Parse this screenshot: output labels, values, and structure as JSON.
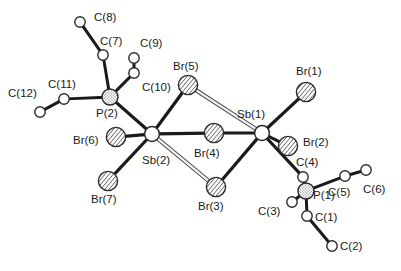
{
  "figure": {
    "kind": "crystal-structure-ortep-diagram",
    "title": "",
    "caption": "",
    "background_color": "#ffffff",
    "label_color": "#1a1a1a",
    "bond_color": "#1a1a1a",
    "hollow_bond_fill": "#f2f2f2",
    "hollow_bond_stroke": "#4d4d4d"
  },
  "styles": {
    "carbon": {
      "name": "carbon-open-circle",
      "fill": "#ffffff",
      "stroke": "#2b2b2b",
      "stroke_width": 1.4,
      "radius": 5.2
    },
    "phosphorus": {
      "name": "phosphorus-stippled-circle",
      "fill": "#e8e8e8",
      "stroke": "#2b2b2b",
      "stroke_width": 1.4,
      "radius": 8.0,
      "pattern": "stipple"
    },
    "bromine": {
      "name": "bromine-hatched-circle",
      "fill": "#d9d9d9",
      "stroke": "#2b2b2b",
      "stroke_width": 1.4,
      "radius": 9.6,
      "pattern": "diagonal-hatch"
    },
    "antimony": {
      "name": "antimony-open-circle",
      "fill": "#ffffff",
      "stroke": "#2b2b2b",
      "stroke_width": 1.5,
      "radius": 7.4
    }
  },
  "atoms": [
    {
      "id": "C8",
      "label": "C(8)",
      "element": "C",
      "style": "carbon",
      "x": 80,
      "y": 22,
      "label_x": 94,
      "label_y": 18,
      "anchor": "start"
    },
    {
      "id": "C7",
      "label": "C(7)",
      "element": "C",
      "style": "carbon",
      "x": 103,
      "y": 55,
      "label_x": 100,
      "label_y": 42,
      "anchor": "start"
    },
    {
      "id": "C9",
      "label": "C(9)",
      "element": "C",
      "style": "carbon",
      "x": 134,
      "y": 58,
      "label_x": 140,
      "label_y": 44,
      "anchor": "start"
    },
    {
      "id": "C10",
      "label": "C(10)",
      "element": "C",
      "style": "carbon",
      "x": 134,
      "y": 73,
      "label_x": 142,
      "label_y": 88,
      "anchor": "start"
    },
    {
      "id": "C11",
      "label": "C(11)",
      "element": "C",
      "style": "carbon",
      "x": 64,
      "y": 99,
      "label_x": 48,
      "label_y": 85,
      "anchor": "start"
    },
    {
      "id": "C12",
      "label": "C(12)",
      "element": "C",
      "style": "carbon",
      "x": 40,
      "y": 112,
      "label_x": 8,
      "label_y": 94,
      "anchor": "start"
    },
    {
      "id": "P2",
      "label": "P(2)",
      "element": "P",
      "style": "phosphorus",
      "x": 110,
      "y": 97,
      "label_x": 96,
      "label_y": 114,
      "anchor": "start"
    },
    {
      "id": "Br5",
      "label": "Br(5)",
      "element": "Br",
      "style": "bromine",
      "x": 188,
      "y": 85,
      "label_x": 173,
      "label_y": 67,
      "anchor": "start"
    },
    {
      "id": "Br6",
      "label": "Br(6)",
      "element": "Br",
      "style": "bromine",
      "x": 116,
      "y": 137,
      "label_x": 73,
      "label_y": 141,
      "anchor": "start"
    },
    {
      "id": "Br7",
      "label": "Br(7)",
      "element": "Br",
      "style": "bromine",
      "x": 108,
      "y": 181,
      "label_x": 91,
      "label_y": 200,
      "anchor": "start"
    },
    {
      "id": "Sb2",
      "label": "Sb(2)",
      "element": "Sb",
      "style": "antimony",
      "x": 152,
      "y": 134,
      "label_x": 142,
      "label_y": 161,
      "anchor": "start"
    },
    {
      "id": "Br4",
      "label": "Br(4)",
      "element": "Br",
      "style": "bromine",
      "x": 214,
      "y": 133,
      "label_x": 194,
      "label_y": 154,
      "anchor": "start"
    },
    {
      "id": "Br3",
      "label": "Br(3)",
      "element": "Br",
      "style": "bromine",
      "x": 216,
      "y": 187,
      "label_x": 198,
      "label_y": 207,
      "anchor": "start"
    },
    {
      "id": "Sb1",
      "label": "Sb(1)",
      "element": "Sb",
      "style": "antimony",
      "x": 262,
      "y": 133,
      "label_x": 237,
      "label_y": 115,
      "anchor": "start"
    },
    {
      "id": "Br1",
      "label": "Br(1)",
      "element": "Br",
      "style": "bromine",
      "x": 306,
      "y": 92,
      "label_x": 296,
      "label_y": 72,
      "anchor": "start"
    },
    {
      "id": "Br2",
      "label": "Br(2)",
      "element": "Br",
      "style": "bromine",
      "x": 288,
      "y": 146,
      "label_x": 303,
      "label_y": 143,
      "anchor": "start"
    },
    {
      "id": "C4",
      "label": "C(4)",
      "element": "C",
      "style": "carbon",
      "x": 303,
      "y": 177,
      "label_x": 296,
      "label_y": 163,
      "anchor": "start"
    },
    {
      "id": "P1",
      "label": "P(1)",
      "element": "P",
      "style": "phosphorus",
      "x": 306,
      "y": 191,
      "label_x": 313,
      "label_y": 196,
      "anchor": "start"
    },
    {
      "id": "C3",
      "label": "C(3)",
      "element": "C",
      "style": "carbon",
      "x": 292,
      "y": 202,
      "label_x": 258,
      "label_y": 212,
      "anchor": "start"
    },
    {
      "id": "C1",
      "label": "C(1)",
      "element": "C",
      "style": "carbon",
      "x": 307,
      "y": 216,
      "label_x": 315,
      "label_y": 218,
      "anchor": "start"
    },
    {
      "id": "C2",
      "label": "C(2)",
      "element": "C",
      "style": "carbon",
      "x": 332,
      "y": 246,
      "label_x": 340,
      "label_y": 247,
      "anchor": "start"
    },
    {
      "id": "C5",
      "label": "C(5)",
      "element": "C",
      "style": "carbon",
      "x": 345,
      "y": 176,
      "label_x": 328,
      "label_y": 193,
      "anchor": "start"
    },
    {
      "id": "C6",
      "label": "C(6)",
      "element": "C",
      "style": "carbon",
      "x": 366,
      "y": 170,
      "label_x": 363,
      "label_y": 190,
      "anchor": "start"
    }
  ],
  "bonds": [
    {
      "from": "C8",
      "to": "C7",
      "type": "solid",
      "width": 3.0
    },
    {
      "from": "C7",
      "to": "P2",
      "type": "solid",
      "width": 3.0
    },
    {
      "from": "C9",
      "to": "C10",
      "type": "solid",
      "width": 3.0
    },
    {
      "from": "C10",
      "to": "P2",
      "type": "solid",
      "width": 3.0
    },
    {
      "from": "C12",
      "to": "C11",
      "type": "solid",
      "width": 3.0
    },
    {
      "from": "C11",
      "to": "P2",
      "type": "solid",
      "width": 3.0
    },
    {
      "from": "P2",
      "to": "Sb2",
      "type": "solid",
      "width": 3.2
    },
    {
      "from": "Sb2",
      "to": "Br5",
      "type": "solid",
      "width": 3.2
    },
    {
      "from": "Sb2",
      "to": "Br6",
      "type": "solid",
      "width": 3.2
    },
    {
      "from": "Sb2",
      "to": "Br7",
      "type": "solid",
      "width": 3.2
    },
    {
      "from": "Sb2",
      "to": "Br4",
      "type": "solid",
      "width": 3.2
    },
    {
      "from": "Sb2",
      "to": "Br3",
      "type": "hollow",
      "width": 4.2
    },
    {
      "from": "Br5",
      "to": "Sb1",
      "type": "hollow",
      "width": 4.2
    },
    {
      "from": "Br4",
      "to": "Sb1",
      "type": "solid",
      "width": 3.2
    },
    {
      "from": "Br3",
      "to": "Sb1",
      "type": "solid",
      "width": 3.2
    },
    {
      "from": "Sb1",
      "to": "Br1",
      "type": "solid",
      "width": 3.2
    },
    {
      "from": "Sb1",
      "to": "Br2",
      "type": "solid",
      "width": 3.2
    },
    {
      "from": "Sb1",
      "to": "C4",
      "type": "solid",
      "width": 3.2
    },
    {
      "from": "C4",
      "to": "P1",
      "type": "solid",
      "width": 3.0
    },
    {
      "from": "P1",
      "to": "C3",
      "type": "solid",
      "width": 3.0
    },
    {
      "from": "P1",
      "to": "C1",
      "type": "solid",
      "width": 3.0
    },
    {
      "from": "C1",
      "to": "C2",
      "type": "solid",
      "width": 3.0
    },
    {
      "from": "P1",
      "to": "C5",
      "type": "solid",
      "width": 3.0
    },
    {
      "from": "C5",
      "to": "C6",
      "type": "solid",
      "width": 3.0
    }
  ]
}
